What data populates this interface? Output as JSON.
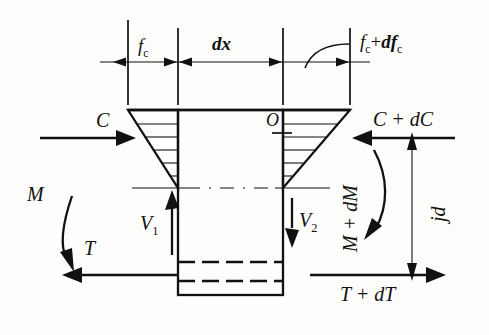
{
  "figure": {
    "kind": "free-body-diagram",
    "dimension_line": {
      "labels": [
        {
          "name": "stress-left-label",
          "text": "f",
          "sub": "c"
        },
        {
          "name": "element-length-label",
          "text": "dx",
          "sub": ""
        },
        {
          "name": "stress-right-label",
          "text": "f",
          "sub": "c"
        }
      ],
      "left_stress": "f_c",
      "length": "dx",
      "right_stress": "f_c + df_c",
      "right_stress_parts": {
        "first": "f",
        "first_sub": "c",
        "plus": "+",
        "second": "df",
        "second_sub": "c"
      }
    },
    "forces": {
      "compression_left": "C",
      "compression_right": "C + dC",
      "moment_left": "M",
      "moment_right": "M + dM",
      "tension_left": "T",
      "tension_right": "T + dT",
      "shear_left": "V",
      "shear_left_sub": "1",
      "shear_right": "V",
      "shear_right_sub": "2",
      "origin_point": "O",
      "lever_arm": "jd"
    },
    "colors": {
      "ink": "#111111",
      "paper": "#fdfdfb"
    }
  }
}
